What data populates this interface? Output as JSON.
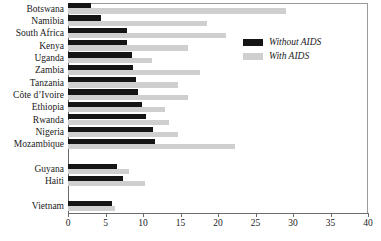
{
  "chart_data": {
    "type": "bar",
    "orientation": "horizontal",
    "title": "",
    "xlabel": "",
    "ylabel": "",
    "xlim": [
      0,
      40
    ],
    "xticks": [
      0,
      5,
      10,
      15,
      20,
      25,
      30,
      35,
      40
    ],
    "grid": false,
    "legend_position": "upper-right-inside",
    "categories": [
      "Botswana",
      "Namibia",
      "South Africa",
      "Kenya",
      "Uganda",
      "Zambia",
      "Tanzania",
      "Côte d’Ivoire",
      "Ethiopia",
      "Rwanda",
      "Nigeria",
      "Mozambique",
      "Guyana",
      "Haiti",
      "Vietnam"
    ],
    "group_breaks_after": [
      "Mozambique",
      "Haiti"
    ],
    "series": [
      {
        "name": "Without AIDS",
        "color": "#151515",
        "values": [
          3.1,
          4.4,
          7.8,
          7.9,
          8.5,
          8.6,
          9.1,
          9.3,
          9.8,
          10.4,
          11.3,
          11.6,
          6.5,
          7.3,
          5.8
        ]
      },
      {
        "name": "With AIDS",
        "color": "#cfcfcf",
        "values": [
          29.0,
          18.5,
          21.0,
          16.0,
          11.2,
          17.6,
          14.6,
          16.0,
          12.9,
          13.4,
          14.6,
          22.2,
          8.1,
          10.3,
          6.2
        ]
      }
    ]
  },
  "legend": {
    "items": [
      {
        "label": "Without AIDS",
        "swatch": "without"
      },
      {
        "label": "With AIDS",
        "swatch": "with"
      }
    ]
  },
  "axis": {
    "tick_labels": [
      "0",
      "5",
      "10",
      "15",
      "20",
      "25",
      "30",
      "35",
      "40"
    ]
  }
}
